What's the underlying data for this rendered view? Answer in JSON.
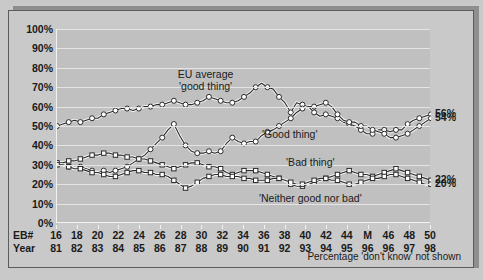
{
  "chart_data": {
    "type": "line",
    "title": "",
    "xlabel": "",
    "ylabel": "",
    "ylim": [
      0,
      100
    ],
    "grid": true,
    "legend_position": "inline-annotations",
    "ytick_labels": [
      "100%",
      "90%",
      "80%",
      "70%",
      "60%",
      "50%",
      "40%",
      "30%",
      "20%",
      "10%",
      "0%"
    ],
    "ytick_values": [
      100,
      90,
      80,
      70,
      60,
      50,
      40,
      30,
      20,
      10,
      0
    ],
    "x_axis_rows": [
      {
        "row_label": "EB#",
        "ticks": [
          "16",
          "18",
          "20",
          "22",
          "24",
          "26",
          "28",
          "30",
          "32",
          "34",
          "36",
          "38",
          "40",
          "42",
          "44",
          "M",
          "46",
          "48",
          "50"
        ]
      },
      {
        "row_label": "Year",
        "ticks": [
          "81",
          "82",
          "83",
          "84",
          "85",
          "86",
          "87",
          "88",
          "89",
          "90",
          "91",
          "92",
          "93",
          "94",
          "95",
          "96",
          "96",
          "97",
          "98"
        ]
      }
    ],
    "footnote": "Percentage 'don't know' not shown",
    "annotations": [
      {
        "text_line1": "EU average",
        "text_line2": "'good thing'",
        "x_pct": 40.0,
        "y_pct": 77.0
      },
      {
        "text_line1": "'Good thing'",
        "text_line2": "",
        "x_pct": 62.5,
        "y_pct": 46.0
      },
      {
        "text_line1": "'Bad thing'",
        "text_line2": "",
        "x_pct": 68.0,
        "y_pct": 31.5
      },
      {
        "text_line1": "'Neither good nor bad'",
        "text_line2": "",
        "x_pct": 68.0,
        "y_pct": 13.0
      }
    ],
    "end_labels": [
      {
        "text": "56%",
        "value": 56
      },
      {
        "text": "54%",
        "value": 54
      },
      {
        "text": "22%",
        "value": 22
      },
      {
        "text": "20%",
        "value": 20
      }
    ],
    "series": [
      {
        "name": "EU average 'good thing'",
        "marker": "circle",
        "values": [
          50,
          51,
          52,
          53,
          52,
          53,
          54,
          54,
          56,
          57,
          58,
          59,
          59,
          58,
          59,
          60,
          60,
          61,
          61,
          62,
          63,
          62,
          61,
          61,
          62,
          63,
          65,
          64,
          63,
          62,
          62,
          63,
          65,
          67,
          70,
          72,
          70,
          69,
          65,
          62,
          57,
          62,
          61,
          60,
          57,
          55,
          56,
          55,
          54,
          52,
          51,
          50,
          48,
          46,
          46,
          48,
          48,
          47,
          48,
          48,
          51,
          53,
          54,
          55,
          56
        ]
      },
      {
        "name": "'Good thing'",
        "marker": "circle",
        "values": [
          31,
          30,
          29,
          28,
          29,
          28,
          27,
          26,
          27,
          26,
          27,
          28,
          29,
          31,
          33,
          35,
          38,
          41,
          44,
          48,
          51,
          45,
          40,
          37,
          36,
          36,
          37,
          36,
          37,
          41,
          44,
          42,
          41,
          42,
          42,
          45,
          47,
          48,
          50,
          52,
          54,
          57,
          59,
          60,
          60,
          61,
          62,
          60,
          56,
          53,
          52,
          52,
          50,
          50,
          48,
          47,
          46,
          44,
          44,
          45,
          46,
          48,
          50,
          52,
          54
        ]
      },
      {
        "name": "'Bad thing'",
        "marker": "square",
        "values": [
          31,
          31,
          32,
          32,
          33,
          34,
          35,
          35,
          36,
          36,
          35,
          35,
          34,
          34,
          33,
          33,
          32,
          31,
          30,
          29,
          28,
          29,
          30,
          31,
          31,
          30,
          29,
          29,
          28,
          26,
          25,
          26,
          27,
          27,
          27,
          26,
          25,
          24,
          23,
          22,
          20,
          19,
          19,
          20,
          21,
          22,
          23,
          24,
          25,
          26,
          27,
          26,
          25,
          25,
          24,
          25,
          26,
          27,
          28,
          27,
          26,
          25,
          24,
          23,
          22
        ]
      },
      {
        "name": "'Neither good nor bad'",
        "marker": "square",
        "values": [
          30,
          30,
          29,
          28,
          28,
          27,
          26,
          26,
          25,
          24,
          24,
          25,
          26,
          27,
          27,
          26,
          26,
          25,
          25,
          24,
          22,
          20,
          18,
          19,
          21,
          23,
          24,
          25,
          25,
          24,
          24,
          24,
          23,
          23,
          22,
          22,
          22,
          23,
          23,
          22,
          21,
          20,
          20,
          21,
          22,
          23,
          23,
          22,
          22,
          21,
          20,
          20,
          21,
          22,
          23,
          23,
          24,
          25,
          25,
          24,
          23,
          22,
          21,
          20,
          20
        ]
      }
    ]
  }
}
